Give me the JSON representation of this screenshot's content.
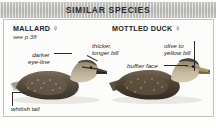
{
  "header": {
    "title": "SIMILAR SPECIES"
  },
  "species": {
    "left": {
      "name": "MALLARD",
      "sex_symbol": "♀",
      "reference": "see p.38"
    },
    "right": {
      "name": "MOTTLED DUCK",
      "sex_symbol": "♀"
    }
  },
  "annotations": [
    {
      "id": "darker-eye-line",
      "line1": "darker",
      "line2": "eye-line"
    },
    {
      "id": "thicker-bill",
      "line1": "thicker,",
      "line2": "longer bill"
    },
    {
      "id": "olive-yellow-bill",
      "line1": "olive to",
      "line2": "yellow bill"
    },
    {
      "id": "buffier-face",
      "line1": "buffier face",
      "line2": ""
    },
    {
      "id": "whitish-tail",
      "line1": "whitish tail",
      "line2": ""
    }
  ],
  "colors": {
    "header_band": "#b9b9b4",
    "frame_border": "#c2c2bc",
    "page_background": "#ffffff",
    "plate_background": "#fcfcfa",
    "text": "#1e1e1e",
    "leader_line": "#2a2a2a",
    "duck_body_dark": "#4a4035",
    "duck_body_mid": "#6e6253",
    "duck_head_light": "#b5a690",
    "bill_dark": "#3a342c",
    "bill_olive": "#9a9a5e"
  }
}
